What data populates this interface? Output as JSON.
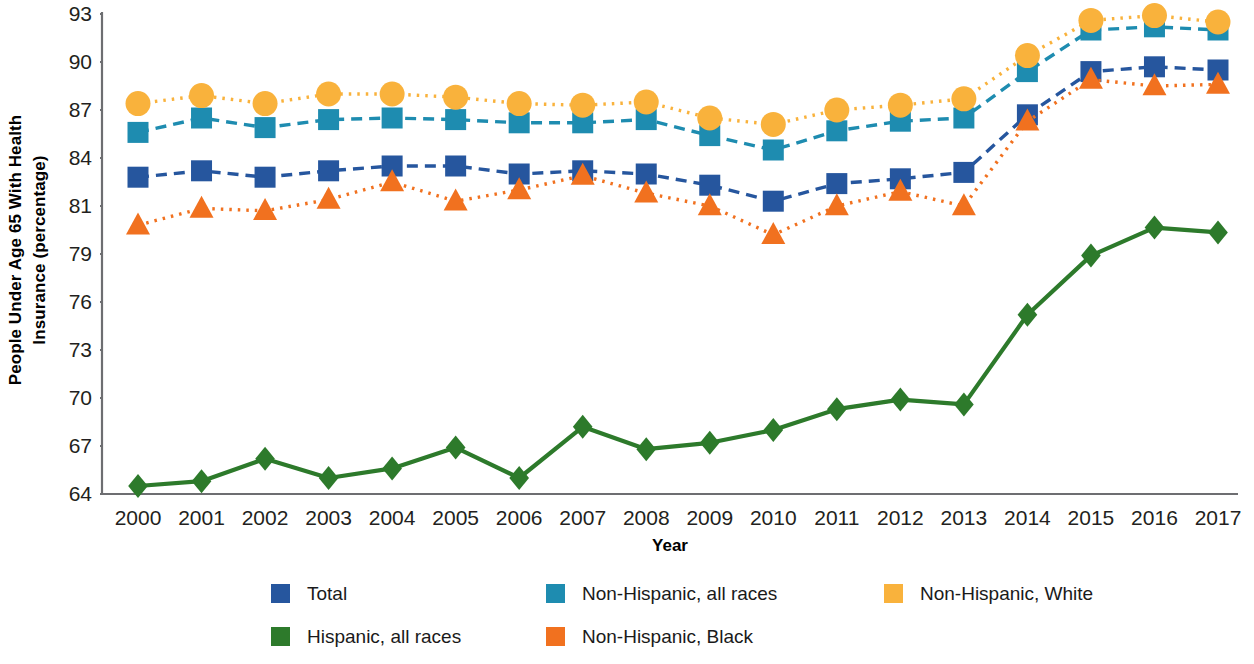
{
  "chart_data": {
    "type": "line",
    "title": "",
    "xlabel": "Year",
    "ylabel": "People Under Age 65 With Health Insurance (percentage)",
    "ylabel_line1": "People Under Age 65 With Health",
    "ylabel_line2": "Insurance (percentage)",
    "categories": [
      "2000",
      "2001",
      "2002",
      "2003",
      "2004",
      "2005",
      "2006",
      "2007",
      "2008",
      "2009",
      "2010",
      "2011",
      "2012",
      "2013",
      "2014",
      "2015",
      "2016",
      "2017"
    ],
    "ytick_labels": [
      "93",
      "90",
      "87",
      "84",
      "81",
      "79",
      "76",
      "73",
      "70",
      "67",
      "64"
    ],
    "ylim": [
      64,
      93
    ],
    "grid": false,
    "legend_position": "bottom",
    "series": [
      {
        "name": "Total",
        "color": "#26569E",
        "marker": "square",
        "linestyle": "dashed",
        "values": [
          82.8,
          83.2,
          82.8,
          83.2,
          83.5,
          83.5,
          83.0,
          83.2,
          83.0,
          82.3,
          81.3,
          82.4,
          82.7,
          83.1,
          86.7,
          89.4,
          89.7,
          89.5
        ]
      },
      {
        "name": "Non-Hispanic, all races",
        "color": "#1E8CB0",
        "marker": "square",
        "linestyle": "dashed",
        "values": [
          85.6,
          86.5,
          85.9,
          86.4,
          86.5,
          86.4,
          86.2,
          86.2,
          86.4,
          85.4,
          84.5,
          85.7,
          86.3,
          86.5,
          89.4,
          92.0,
          92.2,
          92.0
        ]
      },
      {
        "name": "Non-Hispanic, White",
        "color": "#F9B23C",
        "marker": "circle",
        "linestyle": "dotted",
        "values": [
          87.4,
          87.9,
          87.4,
          88.0,
          88.0,
          87.8,
          87.4,
          87.3,
          87.5,
          86.5,
          86.1,
          87.0,
          87.3,
          87.7,
          90.4,
          92.6,
          92.9,
          92.5
        ]
      },
      {
        "name": "Hispanic, all races",
        "color": "#2D7A2B",
        "marker": "diamond",
        "linestyle": "solid",
        "values": [
          64.5,
          64.8,
          66.2,
          65.0,
          65.6,
          66.9,
          65.0,
          68.2,
          66.8,
          67.2,
          68.0,
          69.3,
          69.9,
          69.6,
          75.2,
          78.9,
          80.1,
          79.9
        ]
      },
      {
        "name": "Non-Hispanic, Black",
        "color": "#F1711F",
        "marker": "triangle",
        "linestyle": "dotted",
        "values": [
          80.2,
          80.9,
          80.8,
          81.4,
          82.5,
          81.3,
          82.0,
          82.9,
          81.8,
          81.0,
          79.8,
          81.0,
          81.9,
          81.0,
          86.3,
          88.9,
          88.5,
          88.6
        ]
      }
    ]
  },
  "legend": {
    "items": [
      {
        "label": "Total",
        "color": "#26569E"
      },
      {
        "label": "Non-Hispanic, all races",
        "color": "#1E8CB0"
      },
      {
        "label": "Non-Hispanic, White",
        "color": "#F9B23C"
      },
      {
        "label": "Hispanic, all races",
        "color": "#2D7A2B"
      },
      {
        "label": "Non-Hispanic, Black",
        "color": "#F1711F"
      }
    ]
  },
  "axis": {
    "line_color": "#6d6e71"
  }
}
